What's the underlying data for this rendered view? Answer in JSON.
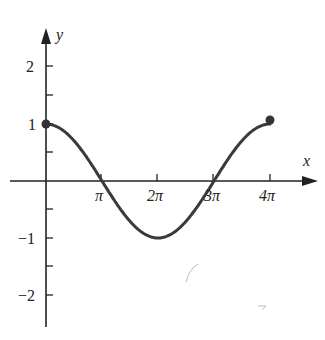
{
  "chart_data": {
    "type": "line",
    "title": "",
    "function": "y = cos(x/2)",
    "xlabel": "x",
    "ylabel": "y",
    "x_ticks": [
      "π",
      "2π",
      "3π",
      "4π"
    ],
    "y_ticks": [
      "2",
      "1",
      "−1",
      "−2"
    ],
    "xlim": [
      0,
      12.566
    ],
    "ylim": [
      -2.5,
      2.5
    ],
    "grid": false,
    "legend": null,
    "x": [
      0,
      3.1416,
      6.2832,
      9.4248,
      12.5664
    ],
    "values": [
      1,
      0,
      -1,
      0,
      1
    ],
    "endpoints": [
      {
        "x": 0,
        "y": 1
      },
      {
        "x": 12.5664,
        "y": 1
      }
    ],
    "colors": {
      "curve": "#3a3a3a",
      "axes": "#222222"
    }
  },
  "labels": {
    "x_axis": "x",
    "y_axis": "y",
    "xt1": "π",
    "xt2": "2π",
    "xt3": "3π",
    "xt4": "4π",
    "yt2": "2",
    "yt1": "1",
    "ytm1": "−1",
    "ytm2": "−2"
  }
}
